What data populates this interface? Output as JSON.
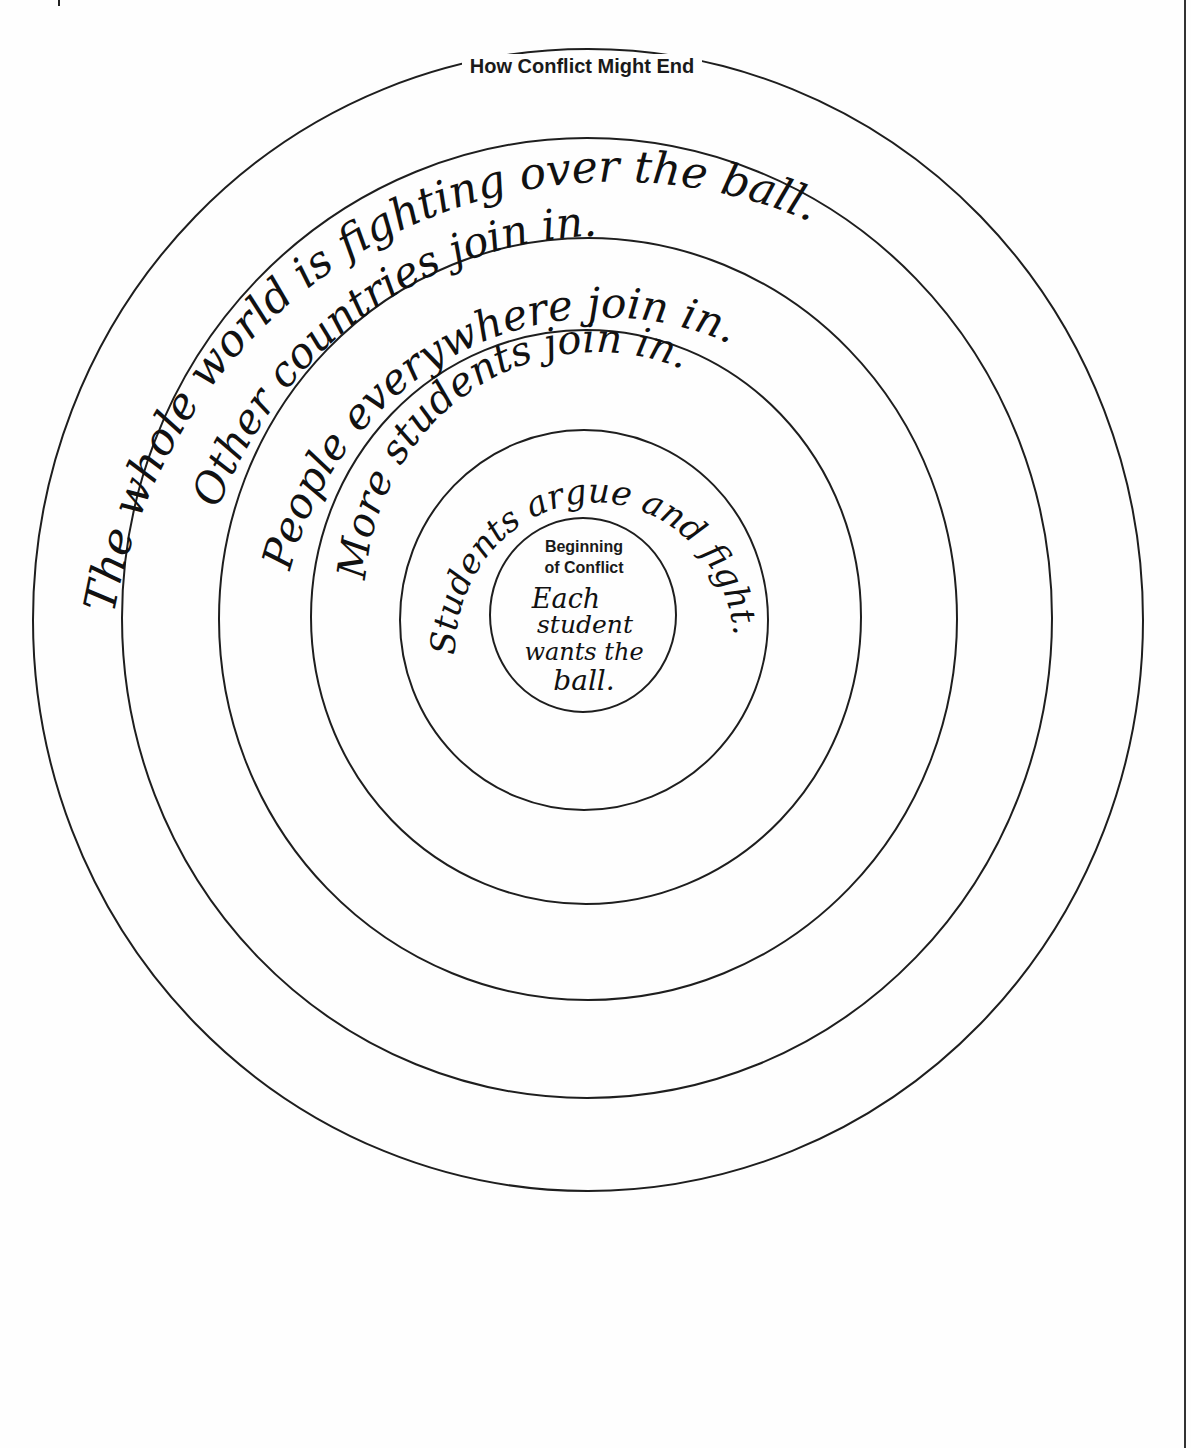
{
  "diagram": {
    "type": "concentric-circles",
    "outer_title": "How Conflict Might End",
    "inner_title_line1": "Beginning",
    "inner_title_line2": "of Conflict",
    "rings": [
      {
        "level": 1,
        "label": "Each student wants the ball.",
        "lines": [
          "Each",
          "student",
          "wants the",
          "ball."
        ]
      },
      {
        "level": 2,
        "label": "Students argue and fight."
      },
      {
        "level": 3,
        "label": "More students join in."
      },
      {
        "level": 4,
        "label": "People everywhere join in."
      },
      {
        "level": 5,
        "label": "Other countries join in."
      },
      {
        "level": 6,
        "label": "The whole world is fighting over the ball."
      }
    ]
  },
  "colors": {
    "ink": "#111111",
    "line": "#1e1e1e",
    "paper": "#fefefe"
  }
}
